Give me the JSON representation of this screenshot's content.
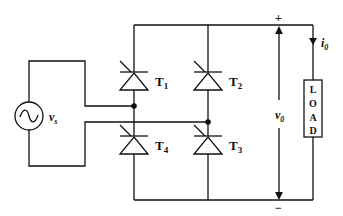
{
  "diagram": {
    "source": {
      "label": "v",
      "subscript": "s",
      "icon": "ac-source-icon"
    },
    "thyristors": [
      {
        "id": "T1",
        "label": "T",
        "subscript": "1"
      },
      {
        "id": "T2",
        "label": "T",
        "subscript": "2"
      },
      {
        "id": "T3",
        "label": "T",
        "subscript": "3"
      },
      {
        "id": "T4",
        "label": "T",
        "subscript": "4"
      }
    ],
    "output_voltage": {
      "label": "v",
      "subscript": "0"
    },
    "output_current": {
      "label": "i",
      "subscript": "0"
    },
    "polarity": {
      "plus": "+",
      "minus": "−"
    },
    "load": {
      "letters": [
        "L",
        "O",
        "A",
        "D"
      ]
    },
    "colors": {
      "line": "#111111",
      "background": "#ffffff"
    }
  }
}
